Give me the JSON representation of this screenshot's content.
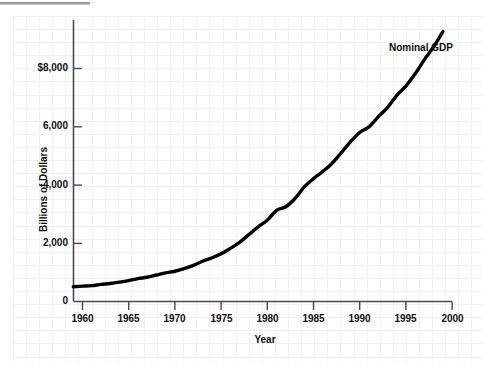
{
  "chart_data": {
    "type": "line",
    "title": "",
    "subtitle": "",
    "xlabel": "Year",
    "ylabel": "Billions of Dollars",
    "xlim": [
      1959,
      2000
    ],
    "ylim": [
      0,
      9400
    ],
    "grid": true,
    "grid_style": "faint graph paper, minor squares",
    "legend": "none",
    "annotations": [
      {
        "text": "Nominal GDP",
        "x": 1995.2,
        "y": 8700
      }
    ],
    "x_tick_labels": [
      "1960",
      "1965",
      "1970",
      "1975",
      "1980",
      "1985",
      "1990",
      "1995",
      "2000"
    ],
    "x_ticks": [
      1960,
      1965,
      1970,
      1975,
      1980,
      1985,
      1990,
      1995,
      2000
    ],
    "y_tick_labels": [
      "0",
      "2,000",
      "4,000",
      "6,000",
      "$8,000"
    ],
    "y_ticks": [
      0,
      2000,
      4000,
      6000,
      8000
    ],
    "series": [
      {
        "name": "Nominal GDP",
        "color": "#000000",
        "x": [
          1959,
          1960,
          1961,
          1962,
          1963,
          1964,
          1965,
          1966,
          1967,
          1968,
          1969,
          1970,
          1971,
          1972,
          1973,
          1974,
          1975,
          1976,
          1977,
          1978,
          1979,
          1980,
          1981,
          1982,
          1983,
          1984,
          1985,
          1986,
          1987,
          1988,
          1989,
          1990,
          1991,
          1992,
          1993,
          1994,
          1995,
          1996,
          1997,
          1998,
          1999
        ],
        "values": [
          506,
          527,
          545,
          586,
          618,
          664,
          719,
          788,
          833,
          910,
          985,
          1039,
          1127,
          1238,
          1383,
          1500,
          1638,
          1825,
          2031,
          2295,
          2563,
          2790,
          3128,
          3255,
          3537,
          3933,
          4220,
          4463,
          4740,
          5104,
          5484,
          5803,
          5996,
          6338,
          6657,
          7072,
          7398,
          7817,
          8304,
          8747,
          9268
        ]
      }
    ]
  },
  "axes": {
    "y_axis_name": "value-axis",
    "x_axis_name": "year-axis"
  }
}
